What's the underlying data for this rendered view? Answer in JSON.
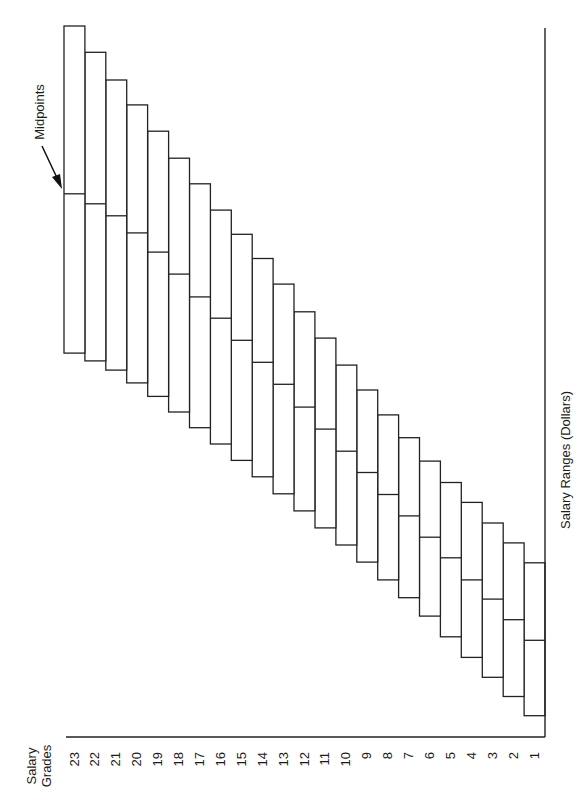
{
  "chart_data": {
    "type": "bar",
    "subtype": "floating-range (salary range boxes with midpoint lines)",
    "orientation": "rotated 90° counter-clockwise on page",
    "title": "",
    "xlabel": "Salary Grades",
    "ylabel": "Salary Ranges (Dollars)",
    "annotation": "Midpoints",
    "value_units": "relative scale 0–100 (no dollar tick values shown)",
    "ylim": [
      0,
      100
    ],
    "grid": false,
    "legend": null,
    "categories": [
      "1",
      "2",
      "3",
      "4",
      "5",
      "6",
      "7",
      "8",
      "9",
      "10",
      "11",
      "12",
      "13",
      "14",
      "15",
      "16",
      "17",
      "18",
      "19",
      "20",
      "21",
      "22",
      "23"
    ],
    "series": [
      {
        "name": "Range minimum",
        "values": [
          3.0,
          5.7,
          8.4,
          11.2,
          14.1,
          17.0,
          19.6,
          22.1,
          24.6,
          27.0,
          29.4,
          31.8,
          34.2,
          36.6,
          38.9,
          41.2,
          43.5,
          45.7,
          47.9,
          49.8,
          51.6,
          52.9,
          54.0
        ]
      },
      {
        "name": "Range midpoint",
        "values": [
          13.6,
          16.5,
          19.4,
          22.1,
          25.2,
          28.1,
          31.1,
          34.1,
          37.2,
          40.2,
          43.3,
          46.4,
          49.6,
          52.7,
          55.8,
          58.9,
          61.9,
          65.1,
          68.2,
          70.9,
          73.3,
          75.0,
          76.4
        ]
      },
      {
        "name": "Range maximum",
        "values": [
          24.5,
          27.3,
          30.1,
          33.0,
          35.8,
          38.8,
          42.1,
          45.3,
          48.8,
          52.3,
          56.1,
          59.8,
          63.7,
          67.3,
          70.7,
          74.1,
          77.8,
          81.4,
          85.2,
          88.9,
          92.4,
          96.3,
          100.0
        ]
      }
    ]
  },
  "labels": {
    "x_axis_title_line1": "Salary",
    "x_axis_title_line2": "Grades",
    "y_axis_title": "Salary Ranges (Dollars)",
    "annotation": "Midpoints"
  }
}
